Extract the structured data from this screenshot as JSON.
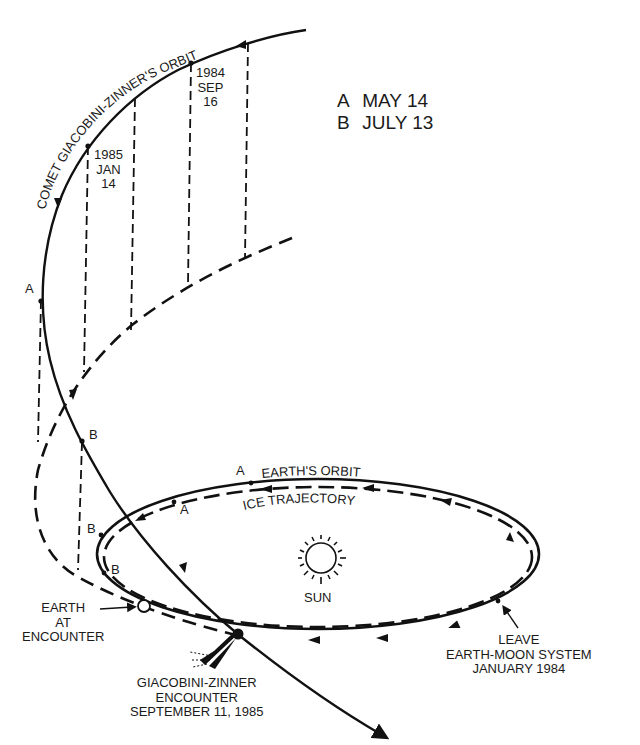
{
  "legend": {
    "items": [
      {
        "key": "A",
        "label": "MAY 14"
      },
      {
        "key": "B",
        "label": "JULY 13"
      }
    ]
  },
  "labels": {
    "comet_orbit": "COMET GIACOBINI-ZINNER'S ORBIT",
    "date_1984": [
      "1984",
      "SEP",
      "16"
    ],
    "date_1985": [
      "1985",
      "JAN",
      "14"
    ],
    "earths_orbit": "EARTH'S ORBIT",
    "ice_trajectory": "ICE TRAJECTORY",
    "sun": "SUN",
    "earth_at_encounter": [
      "EARTH",
      "AT",
      "ENCOUNTER"
    ],
    "gz_encounter": [
      "GIACOBINI-ZINNER",
      "ENCOUNTER",
      "SEPTEMBER 11, 1985"
    ],
    "leave_system": [
      "LEAVE",
      "EARTH-MOON SYSTEM",
      "JANUARY 1984"
    ],
    "marker_a": "A",
    "marker_b": "B"
  },
  "colors": {
    "line": "#111111",
    "background": "#ffffff"
  }
}
